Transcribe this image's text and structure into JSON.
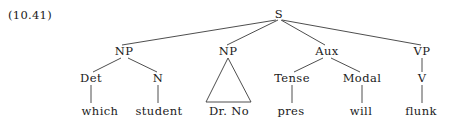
{
  "figure": {
    "example_number": "(10.41)",
    "background_color": "#ffffff",
    "line_color": "#3a3a3a",
    "text_color": "#1a1a1a"
  },
  "tree": {
    "root": {
      "label": "S",
      "x": 279,
      "y": 15
    },
    "nodes": [
      {
        "id": "np-subject",
        "label": "NP",
        "x": 124,
        "y": 52
      },
      {
        "id": "np-object",
        "label": "NP",
        "x": 228,
        "y": 52
      },
      {
        "id": "aux",
        "label": "Aux",
        "x": 327,
        "y": 52
      },
      {
        "id": "vp",
        "label": "VP",
        "x": 422,
        "y": 52
      },
      {
        "id": "det",
        "label": "Det",
        "x": 91,
        "y": 79
      },
      {
        "id": "n",
        "label": "N",
        "x": 158,
        "y": 79
      },
      {
        "id": "tense",
        "label": "Tense",
        "x": 292,
        "y": 79
      },
      {
        "id": "modal",
        "label": "Modal",
        "x": 362,
        "y": 79
      },
      {
        "id": "v",
        "label": "V",
        "x": 422,
        "y": 79
      }
    ],
    "leaves": [
      {
        "id": "leaf-which",
        "label": "which",
        "x": 100,
        "y": 112
      },
      {
        "id": "leaf-student",
        "label": "student",
        "x": 159,
        "y": 112
      },
      {
        "id": "leaf-dr-no",
        "label": "Dr. No",
        "x": 229,
        "y": 112
      },
      {
        "id": "leaf-pres",
        "label": "pres",
        "x": 291,
        "y": 112
      },
      {
        "id": "leaf-will",
        "label": "will",
        "x": 361,
        "y": 112
      },
      {
        "id": "leaf-flunk",
        "label": "flunk",
        "x": 421,
        "y": 112
      }
    ],
    "triangle": {
      "parent": "np-object",
      "covers": "Dr. No",
      "apex_x": 228,
      "apex_y": 58,
      "base_left_x": 206,
      "base_right_x": 251,
      "base_y": 102
    },
    "edges": [
      {
        "from": "S",
        "to": "NP",
        "x1": 276,
        "y1": 20,
        "x2": 122,
        "y2": 45
      },
      {
        "from": "S",
        "to": "NP",
        "x1": 278,
        "y1": 20,
        "x2": 227,
        "y2": 45
      },
      {
        "from": "S",
        "to": "Aux",
        "x1": 281,
        "y1": 20,
        "x2": 325,
        "y2": 45
      },
      {
        "from": "S",
        "to": "VP",
        "x1": 282,
        "y1": 20,
        "x2": 421,
        "y2": 45
      },
      {
        "from": "NP",
        "to": "Det",
        "x1": 121,
        "y1": 58,
        "x2": 93,
        "y2": 72
      },
      {
        "from": "NP",
        "to": "N",
        "x1": 128,
        "y1": 58,
        "x2": 157,
        "y2": 72
      },
      {
        "from": "Aux",
        "to": "Tense",
        "x1": 323,
        "y1": 58,
        "x2": 294,
        "y2": 72
      },
      {
        "from": "Aux",
        "to": "Modal",
        "x1": 331,
        "y1": 58,
        "x2": 360,
        "y2": 72
      },
      {
        "from": "VP",
        "to": "V",
        "x1": 422,
        "y1": 58,
        "x2": 422,
        "y2": 72
      },
      {
        "from": "Det",
        "to": "which",
        "x1": 91,
        "y1": 85,
        "x2": 91,
        "y2": 103
      },
      {
        "from": "N",
        "to": "student",
        "x1": 158,
        "y1": 85,
        "x2": 158,
        "y2": 103
      },
      {
        "from": "Tense",
        "to": "pres",
        "x1": 292,
        "y1": 85,
        "x2": 292,
        "y2": 103
      },
      {
        "from": "Modal",
        "to": "will",
        "x1": 362,
        "y1": 85,
        "x2": 362,
        "y2": 103
      },
      {
        "from": "V",
        "to": "flunk",
        "x1": 422,
        "y1": 85,
        "x2": 422,
        "y2": 103
      }
    ]
  }
}
